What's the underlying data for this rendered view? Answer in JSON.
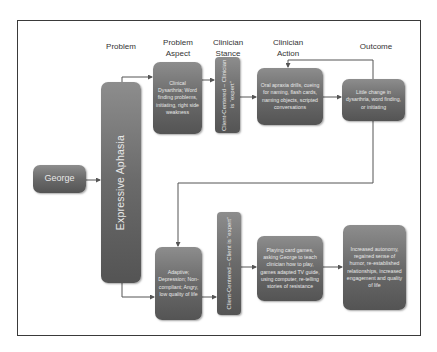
{
  "diagram": {
    "headers": {
      "problem": "Problem",
      "problem_aspect": "Problem Aspect",
      "clinician_stance": "Clinician Stance",
      "clinician_action": "Clinician Action",
      "outcome": "Outcome"
    },
    "client": "George",
    "problem": "Expressive Aphasia",
    "top_row": {
      "problem_aspect": "Clinical Dysarthria; Word finding problems, initiating, right side weakness",
      "clinician_stance": "Client-Centered – Clinician is “expert”",
      "clinician_action": "Oral apraxia drills, cueing for naming, flash cards, naming objects, scripted conversations",
      "outcome": "Little change in dysarthria, word finding, or initiating"
    },
    "bottom_row": {
      "problem_aspect": "Adaptive; Depression; Non-compliant; Angry, low quality of life",
      "clinician_stance": "Client-Centered – Client is “expert”",
      "clinician_action": "Playing card games, asking George to teach clinician how to play, games adapted TV guide, using computer, re-telling stories of resistance",
      "outcome": "Increased autonomy, regained sense of humor, re-established relationships, increased engagement and quality of life"
    },
    "colors": {
      "box_top": "#8d8d8d",
      "box_bottom": "#545454",
      "line": "#555555",
      "frame": "#3a3a3a"
    }
  }
}
